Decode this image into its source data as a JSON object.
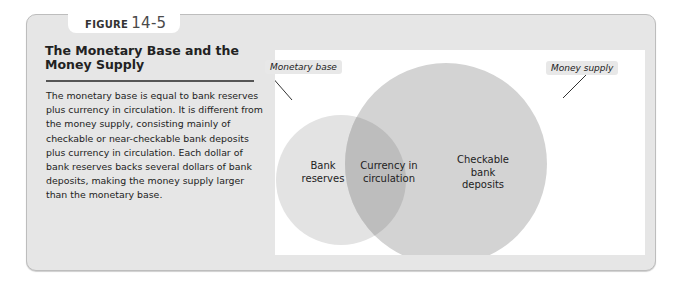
{
  "figure": {
    "label_word": "FIGURE",
    "label_number": "14-5",
    "title": "The Monetary Base and the Money Supply",
    "caption": "The monetary base is equal to bank reserves plus currency in circulation. It is different from the money supply, consisting mainly of checkable or near-checkable bank deposits plus currency in circulation. Each dollar of bank reserves backs several dollars of bank deposits, making the money supply larger than the monetary base."
  },
  "diagram": {
    "type": "venn",
    "callouts": {
      "left": "Monetary base",
      "right": "Money supply"
    },
    "regions": {
      "left_only": [
        "Bank",
        "reserves"
      ],
      "overlap": [
        "Currency in",
        "circulation"
      ],
      "right_only": [
        "Checkable",
        "bank",
        "deposits"
      ]
    },
    "colors": {
      "small_circle": "#e3e3e3",
      "large_circle": "#d3d3d3",
      "overlap": "#bdbdbd",
      "panel_bg": "#e6e6e6",
      "diagram_bg": "#ffffff"
    }
  }
}
